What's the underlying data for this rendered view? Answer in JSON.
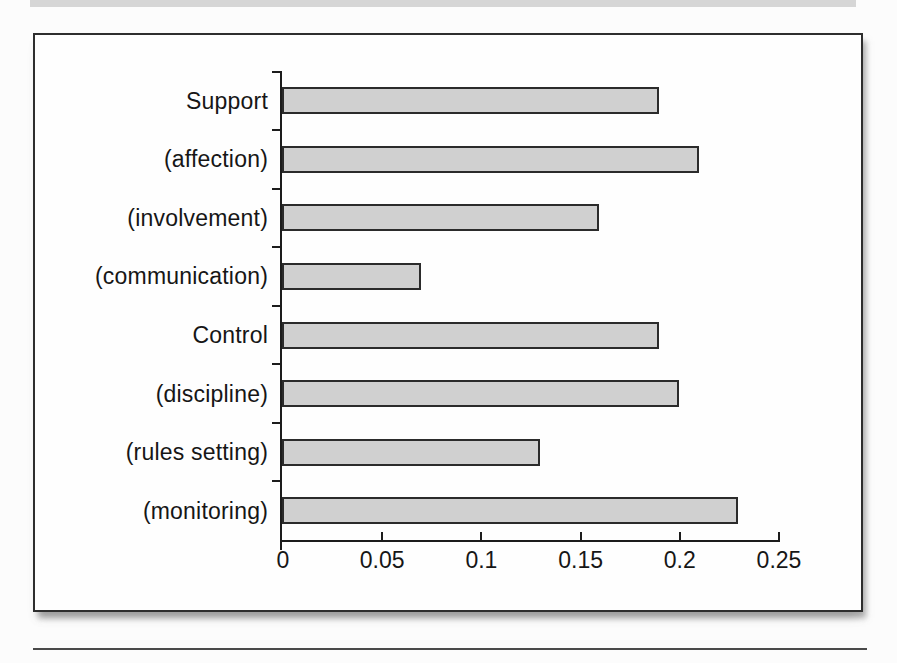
{
  "page": {
    "background": "#fcfcfc",
    "top_band_color": "#d6d6d6",
    "bottom_rule_color": "#4a4a4a"
  },
  "figure": {
    "background": "#fefefe",
    "border_color": "#2e2e2e"
  },
  "chart_data": {
    "type": "bar",
    "orientation": "horizontal",
    "categories": [
      "Support",
      "(affection)",
      "(involvement)",
      "(communication)",
      "Control",
      "(discipline)",
      "(rules setting)",
      "(monitoring)"
    ],
    "values": [
      0.19,
      0.21,
      0.16,
      0.07,
      0.19,
      0.2,
      0.13,
      0.23
    ],
    "xlim": [
      0,
      0.25
    ],
    "x_ticks": [
      0,
      0.05,
      0.1,
      0.15,
      0.2,
      0.25
    ],
    "x_tick_labels": [
      "0",
      "0.05",
      "0.1",
      "0.15",
      "0.2",
      "0.25"
    ],
    "grid": false,
    "legend": "none",
    "title": "",
    "xlabel": "",
    "ylabel": "",
    "bar_fill": "#d0d0d0",
    "bar_border": "#2b2b2b",
    "axis_color": "#1c1c1c",
    "label_color": "#161616"
  }
}
